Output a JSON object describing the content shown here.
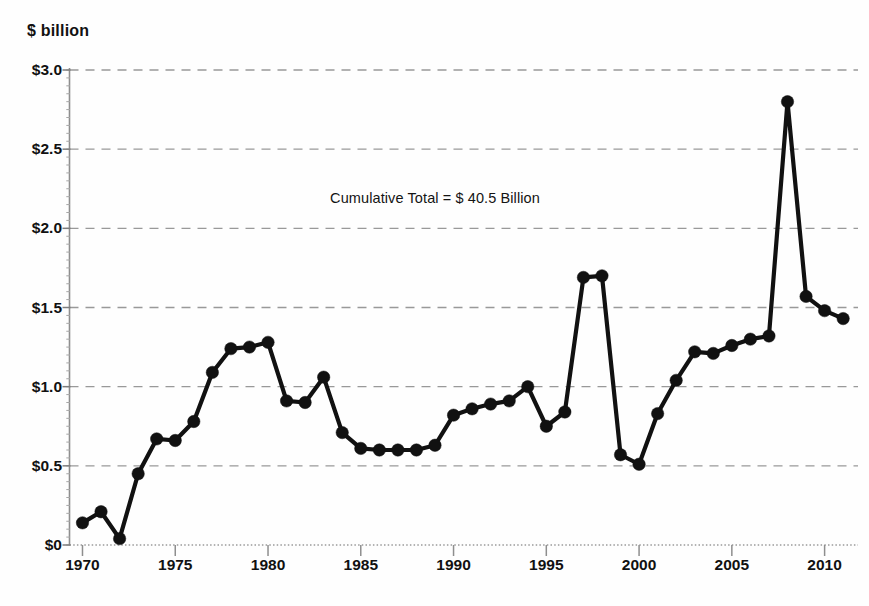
{
  "chart_data": {
    "type": "line",
    "title": "",
    "subtitle": "",
    "xlabel": "",
    "ylabel": "$ billion",
    "unit_label": "$ billion",
    "xlim": [
      1969.3,
      2011.8
    ],
    "ylim": [
      0,
      3.0
    ],
    "grid": true,
    "grid_style": "dashed-horizontal",
    "legend": null,
    "legend_position": "none",
    "marker": "filled-circle",
    "line_color": "#111111",
    "marker_color": "#111111",
    "grid_color": "#999999",
    "axis_color": "#888888",
    "yticks": [
      0,
      0.5,
      1.0,
      1.5,
      2.0,
      2.5,
      3.0
    ],
    "ytick_labels": [
      "$0",
      "$0.5",
      "$1.0",
      "$1.5",
      "$2.0",
      "$2.5",
      "$3.0"
    ],
    "xticks": [
      1970,
      1975,
      1980,
      1985,
      1990,
      1995,
      2000,
      2005,
      2010
    ],
    "xtick_labels": [
      "1970",
      "1975",
      "1980",
      "1985",
      "1990",
      "1995",
      "2000",
      "2005",
      "2010"
    ],
    "annotations": [
      {
        "name": "cumulative-total-annotation",
        "text": "Cumulative Total = $ 40.5 Billion",
        "x": 1989.0,
        "y": 2.19
      }
    ],
    "x": [
      1970,
      1971,
      1972,
      1973,
      1974,
      1975,
      1976,
      1977,
      1978,
      1979,
      1980,
      1981,
      1982,
      1983,
      1984,
      1985,
      1986,
      1987,
      1988,
      1989,
      1990,
      1991,
      1992,
      1993,
      1994,
      1995,
      1996,
      1997,
      1998,
      1999,
      2000,
      2001,
      2002,
      2003,
      2004,
      2005,
      2006,
      2007,
      2008,
      2009,
      2010,
      2011
    ],
    "values": [
      0.14,
      0.21,
      0.04,
      0.45,
      0.67,
      0.66,
      0.78,
      1.09,
      1.24,
      1.25,
      1.28,
      0.91,
      0.9,
      1.06,
      0.71,
      0.61,
      0.6,
      0.6,
      0.6,
      0.63,
      0.82,
      0.86,
      0.89,
      0.91,
      1.0,
      0.75,
      0.84,
      1.69,
      1.7,
      0.57,
      0.51,
      0.83,
      1.04,
      1.22,
      1.21,
      1.26,
      1.3,
      1.32,
      2.8,
      1.57,
      1.48,
      1.43
    ]
  }
}
